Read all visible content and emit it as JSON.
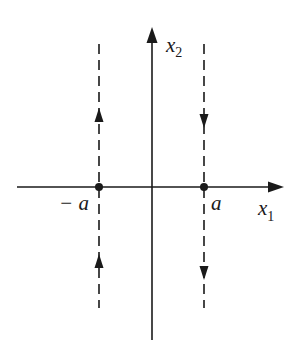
{
  "diagram": {
    "type": "phase-portrait",
    "axes": {
      "horizontal": {
        "label": "x",
        "subscript": "1"
      },
      "vertical": {
        "label": "x",
        "subscript": "2"
      }
    },
    "equilibria": [
      {
        "label": "− a",
        "x_value": "-a"
      },
      {
        "label": "a",
        "x_value": "a"
      }
    ],
    "trajectories": [
      {
        "position": "x1 = -a",
        "style": "dashed",
        "direction_above_axis": "up",
        "direction_below_axis": "up"
      },
      {
        "position": "x1 = a",
        "style": "dashed",
        "direction_above_axis": "down",
        "direction_below_axis": "down"
      }
    ],
    "colors": {
      "ink": "#1a1a1a",
      "background": "#ffffff"
    }
  }
}
